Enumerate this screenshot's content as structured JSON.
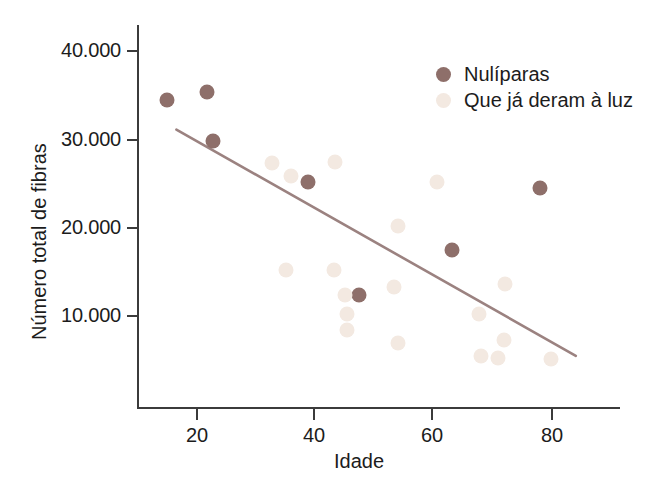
{
  "chart_data": {
    "type": "scatter",
    "title": "",
    "xlabel": "Idade",
    "ylabel": "Número total de fibras",
    "xlim": [
      13,
      94
    ],
    "ylim": [
      1500,
      42000
    ],
    "grid": false,
    "legend_position": "top-right",
    "xticks": [
      20,
      40,
      60,
      80
    ],
    "xticklabels": [
      "20",
      "40",
      "60",
      "80"
    ],
    "yticks": [
      10000,
      20000,
      30000,
      40000
    ],
    "yticklabels": [
      "10.000",
      "20.000",
      "30.000",
      "40.000"
    ],
    "colors": {
      "nuliparas": "#8e6f6a",
      "que_ja_deram_a_luz": "#f3e9e1",
      "trendline": "#9b8280",
      "axis": "#3b3b3b",
      "text": "#1c1c1c",
      "background": "#ffffff"
    },
    "series": [
      {
        "name": "Nulíparas",
        "marker": "circle",
        "color": "#8e6f6a",
        "points": [
          {
            "x": 15.0,
            "y": 34500
          },
          {
            "x": 21.8,
            "y": 35400
          },
          {
            "x": 22.8,
            "y": 29800
          },
          {
            "x": 38.9,
            "y": 25200
          },
          {
            "x": 47.5,
            "y": 12400
          },
          {
            "x": 63.1,
            "y": 17500
          },
          {
            "x": 78.0,
            "y": 24500
          }
        ]
      },
      {
        "name": "Que já deram à luz",
        "marker": "circle",
        "color": "#f3e9e1",
        "points": [
          {
            "x": 32.7,
            "y": 27300
          },
          {
            "x": 35.9,
            "y": 25800
          },
          {
            "x": 43.4,
            "y": 27400
          },
          {
            "x": 60.7,
            "y": 25200
          },
          {
            "x": 54.1,
            "y": 20200
          },
          {
            "x": 35.1,
            "y": 15200
          },
          {
            "x": 43.3,
            "y": 15200
          },
          {
            "x": 72.2,
            "y": 13600
          },
          {
            "x": 53.3,
            "y": 13300
          },
          {
            "x": 45.1,
            "y": 12400
          },
          {
            "x": 45.4,
            "y": 10200
          },
          {
            "x": 45.4,
            "y": 8400
          },
          {
            "x": 67.8,
            "y": 10200
          },
          {
            "x": 54.0,
            "y": 7000
          },
          {
            "x": 71.9,
            "y": 7300
          },
          {
            "x": 68.0,
            "y": 5500
          },
          {
            "x": 71.0,
            "y": 5300
          },
          {
            "x": 79.9,
            "y": 5100
          }
        ]
      }
    ],
    "trendline": {
      "name": "linha de tendência",
      "color": "#9b8280",
      "x_start": 16.6,
      "y_start": 31100,
      "x_end": 84.1,
      "y_end": 5500
    }
  },
  "axis": {
    "x_title": "Idade",
    "y_title": "Número total de fibras"
  },
  "legend": {
    "entries": [
      {
        "label": "Nulíparas",
        "key": "nuliparas"
      },
      {
        "label": "Que já deram à luz",
        "key": "que_ja_deram_a_luz"
      }
    ]
  }
}
